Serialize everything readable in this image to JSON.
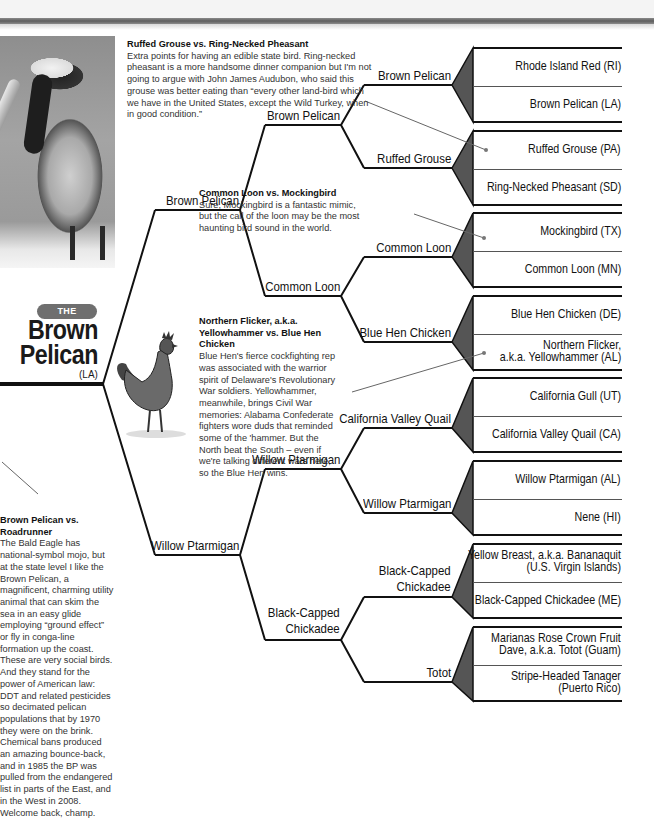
{
  "header": {
    "band_color": "#f4f4f4",
    "bar_color": "#6a6a6a"
  },
  "winner": {
    "badge": "THE WINNER",
    "name_line1": "Brown",
    "name_line2": "Pelican",
    "state": "(LA)",
    "badge_color": "#6f6f6f"
  },
  "articles": [
    {
      "title": "Ruffed Grouse vs. Ring-Necked Pheasant",
      "body": "Extra points for having an edible state bird. Ring-necked pheasant is a more handsome dinner companion but I'm not going to argue with John James Audubon, who said this grouse was better eating than “every other land-bird which we have in the United States, except the Wild Turkey, when in good condition.”"
    },
    {
      "title": "Common Loon vs. Mockingbird",
      "body": "Sure, Mockingbird is a fantastic mimic, but the call of the loon may be the most haunting bird sound in the world."
    },
    {
      "title": "Northern Flicker, a.k.a. Yellowhammer vs. Blue Hen Chicken",
      "body": "Blue Hen's fierce cockfighting rep was associated with the warrior spirit of Delaware's Revolutionary War soldiers. Yellowhammer, meanwhile, brings Civil War memories: Alabama Confederate fighters wore duds that reminded some of the 'hammer. But the North beat the South – even if we're talking different wars here, so the Blue Hen wins."
    },
    {
      "title": "Brown Pelican vs. Roadrunner",
      "body": "The Bald Eagle has national-symbol mojo, but at the state level I like the Brown Pelican, a magnificent, charming utility animal that can skim the sea in an easy glide employing “ground effect” or fly in conga-line formation up the coast. These are very social birds. And they stand for the power of American law: DDT and related pesticides so decimated pelican populations that by 1970 they were on the brink. Chemical bans produced an amazing bounce-back, and in 1985 the BP was pulled from the endangered list in parts of the East, and in the West in 2008. Welcome back, champ."
    }
  ],
  "round1_matchups": [
    {
      "top": "Rhode Island Red (RI)",
      "bottom": "Brown Pelican (LA)",
      "winner": "Brown Pelican"
    },
    {
      "top": "Ruffed Grouse (PA)",
      "bottom": "Ring-Necked Pheasant (SD)",
      "winner": "Ruffed Grouse"
    },
    {
      "top": "Mockingbird (TX)",
      "bottom": "Common Loon (MN)",
      "winner": "Common Loon"
    },
    {
      "top": "Blue Hen Chicken (DE)",
      "bottom_line1": "Northern Flicker,",
      "bottom_line2": "a.k.a. Yellowhammer (AL)",
      "winner": "Blue Hen Chicken"
    },
    {
      "top": "California Gull (UT)",
      "bottom": "California Valley Quail (CA)",
      "winner": "California Valley Quail"
    },
    {
      "top": "Willow Ptarmigan (AL)",
      "bottom": "Nene (HI)",
      "winner": "Willow Ptarmigan"
    },
    {
      "top_line1": "Yellow Breast, a.k.a. Bananaquit",
      "top_line2": "(U.S. Virgin Islands)",
      "bottom": "Black-Capped Chickadee (ME)",
      "winner_line1": "Black-Capped",
      "winner_line2": "Chickadee"
    },
    {
      "top_line1": "Marianas Rose Crown Fruit",
      "top_line2": "Dave, a.k.a. Totot (Guam)",
      "bottom_line1": "Stripe-Headed Tanager",
      "bottom_line2": "(Puerto Rico)",
      "winner": "Totot"
    }
  ],
  "round2_winners": [
    "Brown Pelican",
    "Common Loon",
    "Willow Ptarmigan",
    {
      "line1": "Black-Capped",
      "line2": "Chickadee"
    }
  ],
  "round3_winners": [
    "Brown Pelican",
    "Willow Ptarmigan"
  ],
  "icons": {
    "pelican_photo": "pelican-photo",
    "rooster_illustration": "rooster-illustration"
  }
}
